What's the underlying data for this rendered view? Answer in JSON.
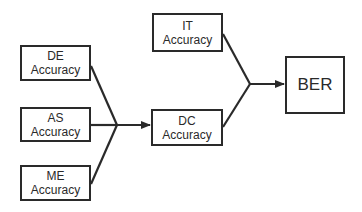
{
  "diagram": {
    "type": "block-flow",
    "nodes": {
      "de": {
        "line1": "DE",
        "line2": "Accuracy"
      },
      "as": {
        "line1": "AS",
        "line2": "Accuracy"
      },
      "me": {
        "line1": "ME",
        "line2": "Accuracy"
      },
      "it": {
        "line1": "IT",
        "line2": "Accuracy"
      },
      "dc": {
        "line1": "DC",
        "line2": "Accuracy"
      },
      "ber": {
        "line1": "BER"
      }
    },
    "edges": [
      {
        "from": [
          "DE Accuracy",
          "AS Accuracy",
          "ME Accuracy"
        ],
        "to": "DC Accuracy"
      },
      {
        "from": [
          "IT Accuracy",
          "DC Accuracy"
        ],
        "to": "BER"
      }
    ],
    "colors": {
      "stroke": "#2a2a2a",
      "background": "#ffffff"
    }
  }
}
